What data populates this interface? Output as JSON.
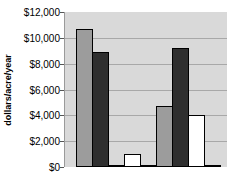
{
  "chart_data": {
    "type": "bar",
    "title": "",
    "xlabel": "",
    "ylabel": "dollars/acre/year",
    "ylim": [
      0,
      12000
    ],
    "yticks": [
      "$0",
      "$2,000",
      "$4,000",
      "$6,000",
      "$8,000",
      "$10,000",
      "$12,000"
    ],
    "grid": true,
    "legend": null,
    "categories": [
      "1",
      "2",
      "3",
      "4",
      "5",
      "6",
      "7",
      "8",
      "9"
    ],
    "values": [
      10700,
      8900,
      100,
      1000,
      100,
      4700,
      9200,
      4000,
      50
    ],
    "bar_colors": [
      "gray",
      "dark",
      "dark",
      "white",
      "dark",
      "gray",
      "dark",
      "white",
      "dark"
    ]
  },
  "colors": {
    "gray": "#9c9c9c",
    "dark": "#2f2f2f",
    "white": "#ffffff",
    "plot_bg": "#d9d9d9",
    "grid": "#a8a8a8"
  }
}
